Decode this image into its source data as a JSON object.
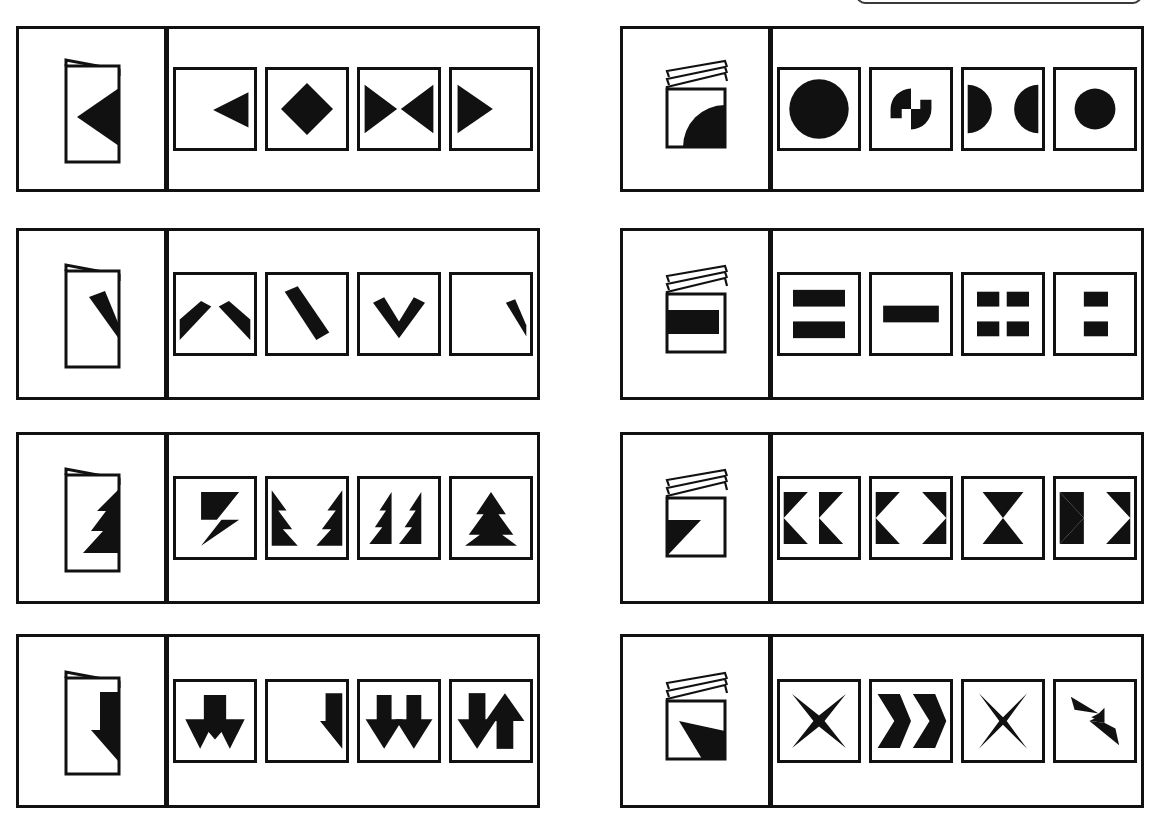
{
  "page": {
    "kind": "paper-folding-reasoning-test",
    "background_color": "#ffffff",
    "ink_color": "#111111",
    "width": 1152,
    "height": 837,
    "top_clipped_box": {
      "visible": true,
      "shape": "rounded-rectangle",
      "border_color": "#3a3a3a"
    }
  },
  "layout": {
    "columns": 2,
    "rows_per_column": 4,
    "panel_width": 524,
    "panel_height": 180,
    "stem_width": 148,
    "option_count": 4
  },
  "problems": [
    {
      "id": "problem-1",
      "column": "left",
      "row": 1,
      "stem": {
        "paper": "card-folded-once-tall",
        "flaps": 1,
        "figure": "left-pointing-triangle-on-fold-edge",
        "figure_name": "triangle-left"
      },
      "options": [
        {
          "label": "A",
          "figure_name": "triangle-left-on-right-edge"
        },
        {
          "label": "B",
          "figure_name": "diamond-centered"
        },
        {
          "label": "C",
          "figure_name": "two-triangles-facing-inward"
        },
        {
          "label": "D",
          "figure_name": "triangle-right-on-left-edge"
        }
      ]
    },
    {
      "id": "problem-2",
      "column": "left",
      "row": 2,
      "stem": {
        "paper": "card-folded-once-tall",
        "flaps": 1,
        "figure": "diagonal-bar-on-fold-edge",
        "figure_name": "bar-diagonal"
      },
      "options": [
        {
          "label": "A",
          "figure_name": "two-diagonal-bars-split-outward"
        },
        {
          "label": "B",
          "figure_name": "single-long-diagonal-bar"
        },
        {
          "label": "C",
          "figure_name": "chevron-v-down"
        },
        {
          "label": "D",
          "figure_name": "short-diagonal-bar-right-edge"
        }
      ]
    },
    {
      "id": "problem-3",
      "column": "left",
      "row": 3,
      "stem": {
        "paper": "card-folded-once-tall",
        "flaps": 1,
        "figure": "tree-zigzag-on-fold-edge",
        "figure_name": "half-tree"
      },
      "options": [
        {
          "label": "A",
          "figure_name": "lightning-bolt-parallelogram"
        },
        {
          "label": "B",
          "figure_name": "two-half-trees-facing-outward"
        },
        {
          "label": "C",
          "figure_name": "two-half-trees-side-by-side"
        },
        {
          "label": "D",
          "figure_name": "whole-tree-centered"
        }
      ]
    },
    {
      "id": "problem-4",
      "column": "left",
      "row": 4,
      "stem": {
        "paper": "card-folded-once-tall",
        "flaps": 1,
        "figure": "down-arrow-half-on-fold-edge",
        "figure_name": "half-down-arrow"
      },
      "options": [
        {
          "label": "A",
          "figure_name": "down-arrow-wide-merged"
        },
        {
          "label": "B",
          "figure_name": "half-down-arrow-right-edge"
        },
        {
          "label": "C",
          "figure_name": "two-down-arrows-separated"
        },
        {
          "label": "D",
          "figure_name": "down-arrow-and-up-arrow"
        }
      ]
    },
    {
      "id": "problem-5",
      "column": "right",
      "row": 1,
      "stem": {
        "paper": "card-folded-twice-square",
        "flaps": 3,
        "figure": "quarter-disc-bottom-right",
        "figure_name": "quarter-circle"
      },
      "options": [
        {
          "label": "A",
          "figure_name": "large-filled-circle"
        },
        {
          "label": "B",
          "figure_name": "pinwheel-two-quarter-discs"
        },
        {
          "label": "C",
          "figure_name": "two-half-discs-on-side-edges"
        },
        {
          "label": "D",
          "figure_name": "small-filled-circle"
        }
      ]
    },
    {
      "id": "problem-6",
      "column": "right",
      "row": 2,
      "stem": {
        "paper": "card-folded-twice-square",
        "flaps": 3,
        "figure": "filled-rectangle-left-half",
        "figure_name": "bar-rectangle"
      },
      "options": [
        {
          "label": "A",
          "figure_name": "two-wide-bars-stacked"
        },
        {
          "label": "B",
          "figure_name": "single-wide-bar-centered"
        },
        {
          "label": "C",
          "figure_name": "four-small-bars-grid"
        },
        {
          "label": "D",
          "figure_name": "two-small-bars-stacked"
        }
      ]
    },
    {
      "id": "problem-7",
      "column": "right",
      "row": 3,
      "stem": {
        "paper": "card-folded-twice-square",
        "flaps": 3,
        "figure": "flag-wedge-lower-left",
        "figure_name": "wedge-flag"
      },
      "options": [
        {
          "label": "A",
          "figure_name": "two-left-pointing-bowties"
        },
        {
          "label": "B",
          "figure_name": "two-bowties-facing-outward"
        },
        {
          "label": "C",
          "figure_name": "hourglass-bowtie-centered"
        },
        {
          "label": "D",
          "figure_name": "two-bowties-facing-inward"
        }
      ]
    },
    {
      "id": "problem-8",
      "column": "right",
      "row": 4,
      "stem": {
        "paper": "card-folded-twice-square",
        "flaps": 3,
        "figure": "sharp-spike-up-left",
        "figure_name": "spike-triangle"
      },
      "options": [
        {
          "label": "A",
          "figure_name": "four-point-star-x"
        },
        {
          "label": "B",
          "figure_name": "two-right-chevrons"
        },
        {
          "label": "C",
          "figure_name": "four-point-star-tall"
        },
        {
          "label": "D",
          "figure_name": "lightning-zigzag-diagonal"
        }
      ]
    }
  ]
}
